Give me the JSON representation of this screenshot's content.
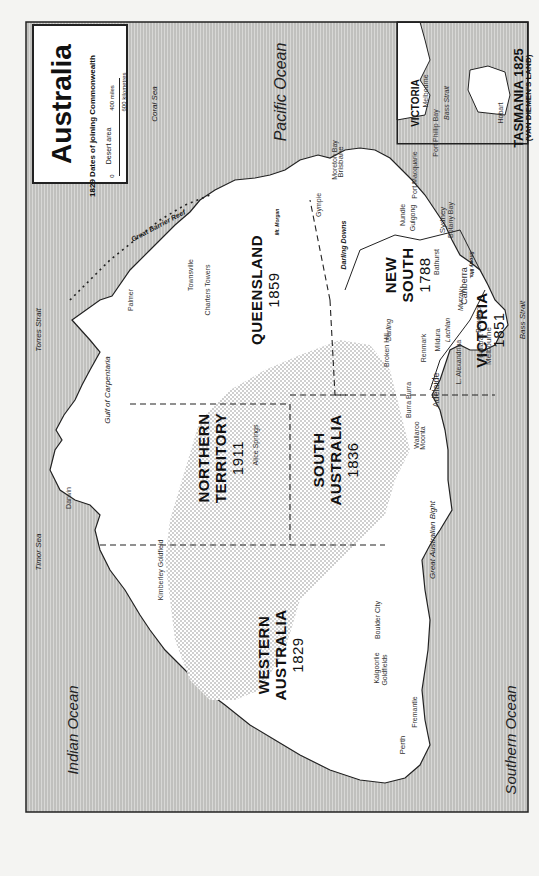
{
  "map": {
    "title": "Australia",
    "legend": {
      "dates_label": "1829 Dates of joining Commonwealth",
      "desert_label": "Desert area",
      "scale_miles": "400 miles",
      "scale_km": "600 kilometres",
      "scale_zero_a": "0",
      "scale_zero_b": "0"
    },
    "oceans": {
      "pacific": "Pacific Ocean",
      "indian": "Indian Ocean",
      "southern": "Southern Ocean",
      "coral_sea": "Coral Sea",
      "timor_sea": "Timor Sea",
      "torres_strait": "Torres Strait",
      "gulf_carpentaria": "Gulf of Carpentaria",
      "great_australian_bight": "Great Australian Bight",
      "bass_strait": "Bass Strait",
      "great_barrier_reef": "Great Barrier Reef"
    },
    "states": [
      {
        "name": "QUEENSLAND",
        "year": "1859"
      },
      {
        "name": "NORTHERN",
        "name2": "TERRITORY",
        "year": "1911"
      },
      {
        "name": "SOUTH",
        "name2": "AUSTRALIA",
        "year": "1836"
      },
      {
        "name": "WESTERN",
        "name2": "AUSTRALIA",
        "year": "1829"
      },
      {
        "name": "NEW",
        "name2": "SOUTH",
        "name3": "WALES",
        "year": "1788"
      },
      {
        "name": "VICTORIA",
        "year": "1851"
      }
    ],
    "features": {
      "darling_downs": "Darling Downs",
      "mt_morgan": "Mt. Morgan",
      "snowy_mts": "Snowy Mts.",
      "darling_river": "Darling",
      "lachlan_river": "Lachlan",
      "murray_river": "Murray",
      "l_alexandrina": "L. Alexandrina"
    },
    "towns": {
      "darwin": "Darwin",
      "palmer": "Palmer",
      "townsville": "Townsville",
      "charters_towers": "Charters Towers",
      "gympie": "Gympie",
      "brisbane": "Brisbane",
      "moreton_bay": "Moreton Bay",
      "nundle": "Nundle",
      "gulgong": "Gulgong",
      "port_macquarie": "Port Macquarie",
      "sydney": "Sydney",
      "botany_bay": "Botany Bay",
      "bathurst": "Bathurst",
      "canberra": "Canberra",
      "bendigo": "Bendigo",
      "ballarat": "Ballarat",
      "melbourne": "Melbourne",
      "broken_hill": "Broken Hill",
      "renmark": "Renmark",
      "mildura": "Mildura",
      "adelaide": "Adelaide",
      "burra_burra": "Burra Burra",
      "wallaroo": "Wallaroo",
      "moonta": "Moonta",
      "alice_springs": "Alice Springs",
      "kimberley_goldfield": "Kimberley Goldfield",
      "kalgoorlie": "Kalgoorlie",
      "boulder_city": "Boulder City",
      "goldfields": "Goldfields",
      "perth": "Perth",
      "fremantle": "Fremantle"
    },
    "inset": {
      "victoria_label": "VICTORIA",
      "melbourne": "Melbourne",
      "port_phillip_bay": "Port Phillip Bay",
      "bass_strait": "Bass Strait",
      "hobart": "Hobart",
      "tasmania_title": "TASMANIA 1825",
      "tasmania_subtitle": "(VAN DIEMEN'S LAND)"
    }
  }
}
